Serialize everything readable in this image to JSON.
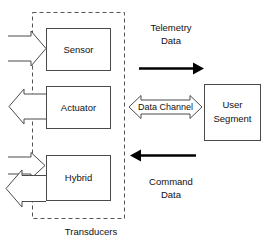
{
  "diagram": {
    "group_label": "Transducers",
    "colors": {
      "box_stroke": "#4a4a4a",
      "dashed_stroke": "#555555",
      "solid_arrow": "#000000",
      "text": "#111111",
      "background": "#ffffff"
    },
    "boxes": [
      {
        "id": "sensor",
        "label": "Sensor"
      },
      {
        "id": "actuator",
        "label": "Actuator"
      },
      {
        "id": "hybrid",
        "label": "Hybrid"
      },
      {
        "id": "user_segment",
        "label_line1": "User",
        "label_line2": "Segment"
      }
    ],
    "channel": {
      "label": "Data Channel"
    },
    "flows": [
      {
        "id": "telemetry",
        "label_line1": "Telemetry",
        "label_line2": "Data",
        "direction": "right"
      },
      {
        "id": "command",
        "label_line1": "Command",
        "label_line2": "Data",
        "direction": "left"
      }
    ]
  }
}
